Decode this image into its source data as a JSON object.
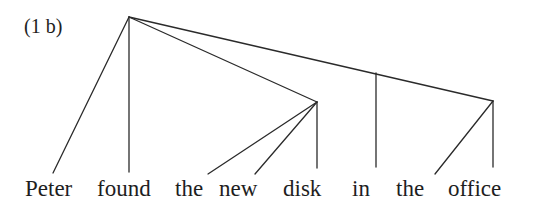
{
  "diagram": {
    "label": "(1 b)",
    "words": [
      {
        "text": "Peter",
        "x": 25
      },
      {
        "text": "found",
        "x": 97
      },
      {
        "text": "the",
        "x": 175
      },
      {
        "text": "new",
        "x": 219
      },
      {
        "text": "disk",
        "x": 283
      },
      {
        "text": "in",
        "x": 352
      },
      {
        "text": "the",
        "x": 396
      },
      {
        "text": "office",
        "x": 448
      }
    ],
    "nodes": {
      "root": {
        "x": 129,
        "y": 17
      },
      "np_object": {
        "x": 317,
        "y": 102
      },
      "pp": {
        "x": 376,
        "y": 73
      },
      "np_office": {
        "x": 493,
        "y": 101
      }
    },
    "edges": [
      {
        "from": "root",
        "to": "Peter",
        "x1": 129,
        "y1": 17,
        "x2": 53,
        "y2": 173
      },
      {
        "from": "root",
        "to": "found",
        "x1": 129,
        "y1": 17,
        "x2": 129,
        "y2": 172
      },
      {
        "from": "root",
        "to": "np_object",
        "x1": 129,
        "y1": 17,
        "x2": 317,
        "y2": 102
      },
      {
        "from": "root",
        "to": "np_office",
        "x1": 129,
        "y1": 17,
        "x2": 493,
        "y2": 101
      },
      {
        "from": "pp",
        "to": "in",
        "x1": 376,
        "y1": 73,
        "x2": 376,
        "y2": 167
      },
      {
        "from": "np_object",
        "to": "the",
        "x1": 317,
        "y1": 102,
        "x2": 208,
        "y2": 174
      },
      {
        "from": "np_object",
        "to": "new",
        "x1": 317,
        "y1": 102,
        "x2": 255,
        "y2": 174
      },
      {
        "from": "np_object",
        "to": "disk",
        "x1": 317,
        "y1": 102,
        "x2": 317,
        "y2": 168
      },
      {
        "from": "np_office",
        "to": "the",
        "x1": 493,
        "y1": 101,
        "x2": 435,
        "y2": 174
      },
      {
        "from": "np_office",
        "to": "office",
        "x1": 493,
        "y1": 101,
        "x2": 493,
        "y2": 167
      }
    ]
  }
}
